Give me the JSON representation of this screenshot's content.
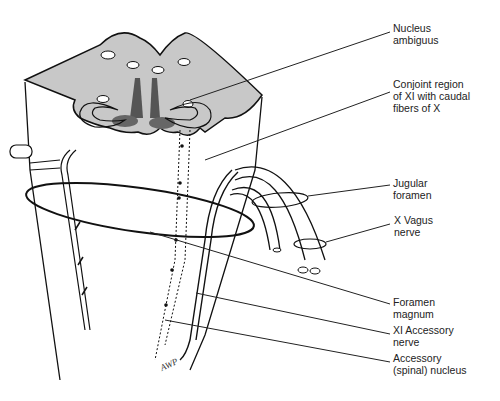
{
  "figure": {
    "colors": {
      "gray_matter_section": "#c8c8c8",
      "ink": "#111111",
      "background": "#ffffff"
    },
    "labels": [
      {
        "id": "nucleus-ambiguus",
        "lines": [
          "Nucleus",
          "ambiguus"
        ],
        "x": 393,
        "y": 22
      },
      {
        "id": "conjoint-region",
        "lines": [
          "Conjoint region",
          "of XI with caudal",
          "fibers of X"
        ],
        "x": 393,
        "y": 78
      },
      {
        "id": "jugular-foramen",
        "lines": [
          "Jugular",
          "foramen"
        ],
        "x": 393,
        "y": 177
      },
      {
        "id": "x-vagus-nerve",
        "lines": [
          "X Vagus",
          "nerve"
        ],
        "x": 394,
        "y": 214
      },
      {
        "id": "foramen-magnum",
        "lines": [
          "Foramen",
          "magnum"
        ],
        "x": 393,
        "y": 296
      },
      {
        "id": "xi-accessory-nerve",
        "lines": [
          "XI Accessory",
          "nerve"
        ],
        "x": 393,
        "y": 324
      },
      {
        "id": "accessory-spinal-nucleus",
        "lines": [
          "Accessory",
          "(spinal) nucleus"
        ],
        "x": 393,
        "y": 352
      }
    ],
    "signature": "AWP"
  }
}
